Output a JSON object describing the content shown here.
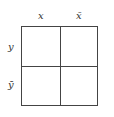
{
  "diagram": {
    "type": "karnaugh-map",
    "column_labels": [
      "x",
      "x̄"
    ],
    "row_labels": [
      "y",
      "ȳ"
    ],
    "cells": [
      [
        "",
        ""
      ],
      [
        "",
        ""
      ]
    ],
    "line_color": "#444444"
  }
}
